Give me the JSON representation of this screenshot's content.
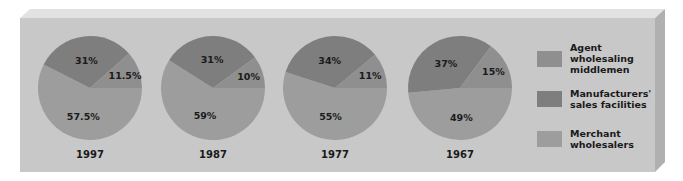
{
  "colors": {
    "background": "#ffffff",
    "box_front": "#c8c8c8",
    "box_top": "#e2e2e2",
    "box_side": "#b0b0b0",
    "agent": "#8f8f8f",
    "manufacturers": "#7e7e7e",
    "merchant": "#9d9d9d"
  },
  "legend": [
    {
      "key": "agent",
      "label": "Agent wholesaling middlemen"
    },
    {
      "key": "manufacturers",
      "label": "Manufacturers' sales facilities"
    },
    {
      "key": "merchant",
      "label": "Merchant wholesalers"
    }
  ],
  "pies": [
    {
      "year": "1997",
      "slices": [
        {
          "key": "manufacturers",
          "value": 31,
          "label": "31%"
        },
        {
          "key": "agent",
          "value": 11.5,
          "label": "11.5%"
        },
        {
          "key": "merchant",
          "value": 57.5,
          "label": "57.5%"
        }
      ]
    },
    {
      "year": "1987",
      "slices": [
        {
          "key": "manufacturers",
          "value": 31,
          "label": "31%"
        },
        {
          "key": "agent",
          "value": 10,
          "label": "10%"
        },
        {
          "key": "merchant",
          "value": 59,
          "label": "59%"
        }
      ]
    },
    {
      "year": "1977",
      "slices": [
        {
          "key": "manufacturers",
          "value": 34,
          "label": "34%"
        },
        {
          "key": "agent",
          "value": 11,
          "label": "11%"
        },
        {
          "key": "merchant",
          "value": 55,
          "label": "55%"
        }
      ]
    },
    {
      "year": "1967",
      "slices": [
        {
          "key": "manufacturers",
          "value": 37,
          "label": "37%"
        },
        {
          "key": "agent",
          "value": 15,
          "label": "15%"
        },
        {
          "key": "merchant",
          "value": 49,
          "label": "49%"
        }
      ]
    }
  ],
  "chart_data": [
    {
      "type": "pie",
      "title": "1997",
      "categories": [
        "Manufacturers' sales facilities",
        "Agent wholesaling middlemen",
        "Merchant wholesalers"
      ],
      "values": [
        31,
        11.5,
        57.5
      ]
    },
    {
      "type": "pie",
      "title": "1987",
      "categories": [
        "Manufacturers' sales facilities",
        "Agent wholesaling middlemen",
        "Merchant wholesalers"
      ],
      "values": [
        31,
        10,
        59
      ]
    },
    {
      "type": "pie",
      "title": "1977",
      "categories": [
        "Manufacturers' sales facilities",
        "Agent wholesaling middlemen",
        "Merchant wholesalers"
      ],
      "values": [
        34,
        11,
        55
      ]
    },
    {
      "type": "pie",
      "title": "1967",
      "categories": [
        "Manufacturers' sales facilities",
        "Agent wholesaling middlemen",
        "Merchant wholesalers"
      ],
      "values": [
        37,
        15,
        49
      ]
    }
  ]
}
